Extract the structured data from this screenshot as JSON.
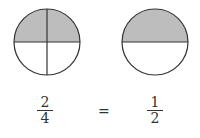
{
  "diagram": {
    "colors": {
      "shaded": "#bdbdbd",
      "stroke": "#333333",
      "background": "#ffffff"
    },
    "circles": [
      {
        "label": "two-quarters",
        "parts": 4,
        "shaded": 2
      },
      {
        "label": "one-half",
        "parts": 2,
        "shaded": 1
      }
    ],
    "equation": {
      "left": {
        "numerator": "2",
        "denominator": "4"
      },
      "operator": "=",
      "right": {
        "numerator": "1",
        "denominator": "2"
      }
    }
  }
}
